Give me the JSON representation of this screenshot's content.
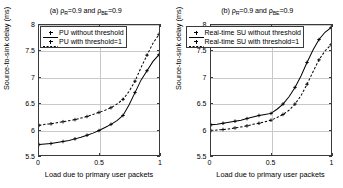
{
  "figure": {
    "axis_label_x": "Load due to primary user packets",
    "axis_label_y": "Source-to-sink delay (ms)"
  },
  "panel_a": {
    "title_prefix": "(a) ",
    "title_rho1": "ρ",
    "title_sub1": "R",
    "title_mid": "=0.9 and ",
    "title_rho2": "ρ",
    "title_sub2": "BE",
    "title_end": "=0.9",
    "title_full": "(a) ρR=0.9 and ρBE=0.9",
    "legend": [
      {
        "label": "PU without threshold",
        "style": "solid"
      },
      {
        "label": "PU with threshold=1",
        "style": "dashed"
      }
    ]
  },
  "panel_b": {
    "title_prefix": "(b) ",
    "title_rho1": "ρ",
    "title_sub1": "R",
    "title_mid": "=0.9 and ",
    "title_rho2": "ρ",
    "title_sub2": "BE",
    "title_end": "=0.9",
    "title_full": "(b) ρR=0.9 and ρBE=0.9",
    "legend": [
      {
        "label": "Real-time SU without threshold",
        "style": "solid"
      },
      {
        "label": "Real-time SU with threshold=1",
        "style": "dashed"
      }
    ]
  },
  "ticks": {
    "y": [
      "5.5",
      "6",
      "6.5",
      "7",
      "7.5",
      "8"
    ],
    "x": [
      "0",
      "0.5",
      "1"
    ]
  },
  "chart_data": [
    {
      "type": "line",
      "title": "(a) ρR=0.9 and ρBE=0.9",
      "xlabel": "Load due to primary user packets",
      "ylabel": "Source-to-sink delay (ms)",
      "xlim": [
        0,
        1
      ],
      "ylim": [
        5.5,
        8
      ],
      "xticks": [
        0,
        0.5,
        1
      ],
      "yticks": [
        5.5,
        6,
        6.5,
        7,
        7.5,
        8
      ],
      "grid": true,
      "legend_position": "upper-left",
      "series": [
        {
          "name": "PU without threshold",
          "style": "solid",
          "marker": "plus",
          "x": [
            0,
            0.05,
            0.1,
            0.15,
            0.2,
            0.25,
            0.3,
            0.35,
            0.4,
            0.45,
            0.5,
            0.55,
            0.6,
            0.65,
            0.7,
            0.75,
            0.8,
            0.85,
            0.9,
            0.95,
            1.0
          ],
          "y": [
            5.7,
            5.71,
            5.72,
            5.74,
            5.76,
            5.78,
            5.81,
            5.84,
            5.88,
            5.92,
            5.97,
            6.03,
            6.09,
            6.16,
            6.26,
            6.46,
            6.7,
            6.94,
            7.12,
            7.3,
            7.43
          ]
        },
        {
          "name": "PU with threshold=1",
          "style": "dashed",
          "marker": "plus",
          "x": [
            0,
            0.05,
            0.1,
            0.15,
            0.2,
            0.25,
            0.3,
            0.35,
            0.4,
            0.45,
            0.5,
            0.55,
            0.6,
            0.65,
            0.7,
            0.75,
            0.8,
            0.85,
            0.9,
            0.95,
            1.0
          ],
          "y": [
            6.07,
            6.09,
            6.1,
            6.12,
            6.14,
            6.16,
            6.18,
            6.21,
            6.24,
            6.28,
            6.32,
            6.36,
            6.41,
            6.48,
            6.57,
            6.72,
            6.92,
            7.18,
            7.42,
            7.65,
            7.82
          ]
        }
      ]
    },
    {
      "type": "line",
      "title": "(b) ρR=0.9 and ρBE=0.9",
      "xlabel": "Load due to primary user packets",
      "ylabel": "Source-to-sink delay (ms)",
      "xlim": [
        0,
        1
      ],
      "ylim": [
        5.5,
        8
      ],
      "xticks": [
        0,
        0.5,
        1
      ],
      "yticks": [
        5.5,
        6,
        6.5,
        7,
        7.5,
        8
      ],
      "grid": true,
      "legend_position": "upper-left",
      "series": [
        {
          "name": "Real-time SU without threshold",
          "style": "solid",
          "marker": "plus",
          "x": [
            0,
            0.05,
            0.1,
            0.15,
            0.2,
            0.25,
            0.3,
            0.35,
            0.4,
            0.45,
            0.5,
            0.55,
            0.6,
            0.65,
            0.7,
            0.75,
            0.8,
            0.85,
            0.9,
            0.95,
            1.0
          ],
          "y": [
            6.08,
            6.09,
            6.11,
            6.13,
            6.15,
            6.17,
            6.2,
            6.23,
            6.26,
            6.28,
            6.3,
            6.38,
            6.48,
            6.62,
            6.8,
            7.02,
            7.28,
            7.52,
            7.72,
            7.86,
            7.95
          ]
        },
        {
          "name": "Real-time SU with threshold=1",
          "style": "dashed",
          "marker": "plus",
          "x": [
            0,
            0.05,
            0.1,
            0.15,
            0.2,
            0.25,
            0.3,
            0.35,
            0.4,
            0.45,
            0.5,
            0.55,
            0.6,
            0.65,
            0.7,
            0.75,
            0.8,
            0.85,
            0.9,
            0.95,
            1.0
          ],
          "y": [
            5.97,
            5.98,
            5.99,
            6.0,
            6.02,
            6.04,
            6.06,
            6.09,
            6.11,
            6.14,
            6.17,
            6.22,
            6.28,
            6.36,
            6.48,
            6.64,
            6.86,
            7.1,
            7.33,
            7.5,
            7.62
          ]
        }
      ]
    }
  ],
  "colors": {
    "line": "#000000",
    "grid": "#c9c9c9",
    "frame": "#3a3a3a",
    "background": "#ffffff"
  }
}
